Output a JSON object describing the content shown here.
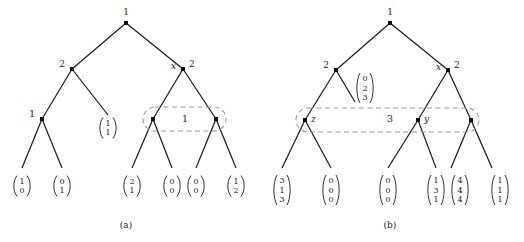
{
  "figure": {
    "background": "#ffffff",
    "ink": "#1a1a1a",
    "dash_color": "#9a9a9a"
  },
  "panels": [
    {
      "id": "a",
      "caption": "(a)",
      "caption_pos": {
        "x": 126,
        "y": 228
      },
      "nodes": [
        {
          "name": "root",
          "x": 126,
          "y": 23,
          "label": "1",
          "label_pos": "top",
          "lx": 126,
          "ly": 15
        },
        {
          "name": "left-2",
          "x": 72,
          "y": 69,
          "label": "2",
          "label_pos": "left",
          "lx": 65,
          "ly": 67
        },
        {
          "name": "right-2",
          "x": 183,
          "y": 69,
          "label": "2",
          "label_pos": "right",
          "lx": 189,
          "ly": 67
        },
        {
          "name": "right-2-x",
          "x": 183,
          "y": 69,
          "label": "x",
          "label_pos": "left-italic",
          "lx": 176,
          "ly": 69
        },
        {
          "name": "left-1",
          "x": 42,
          "y": 119,
          "label": "1",
          "label_pos": "left",
          "lx": 35,
          "ly": 117
        },
        {
          "name": "group-left",
          "x": 153,
          "y": 119,
          "label": "",
          "label_pos": "none",
          "lx": 0,
          "ly": 0
        },
        {
          "name": "group-right",
          "x": 216,
          "y": 119,
          "label": "",
          "label_pos": "none",
          "lx": 0,
          "ly": 0
        }
      ],
      "edges": [
        [
          126,
          23,
          72,
          69
        ],
        [
          126,
          23,
          183,
          69
        ],
        [
          72,
          69,
          42,
          119
        ],
        [
          72,
          69,
          108,
          115
        ],
        [
          183,
          69,
          153,
          119
        ],
        [
          183,
          69,
          216,
          119
        ],
        [
          42,
          119,
          22,
          168
        ],
        [
          42,
          119,
          62,
          168
        ],
        [
          153,
          119,
          132,
          168
        ],
        [
          153,
          119,
          172,
          168
        ],
        [
          216,
          119,
          196,
          168
        ],
        [
          216,
          119,
          236,
          168
        ]
      ],
      "group": {
        "name": "dashed-group-a",
        "label": "1",
        "label_x": 185,
        "label_y": 122,
        "x": 143,
        "y": 107,
        "width": 83,
        "height": 24
      },
      "vectors": [
        {
          "name": "vector-1-1-internal",
          "x": 108,
          "y": 128,
          "entries": [
            "1",
            "1"
          ]
        },
        {
          "name": "vector-leaf-1",
          "x": 22,
          "y": 186,
          "entries": [
            "1",
            "0"
          ]
        },
        {
          "name": "vector-leaf-2",
          "x": 62,
          "y": 186,
          "entries": [
            "0",
            "1"
          ]
        },
        {
          "name": "vector-leaf-3",
          "x": 132,
          "y": 186,
          "entries": [
            "2",
            "1"
          ]
        },
        {
          "name": "vector-leaf-4",
          "x": 172,
          "y": 186,
          "entries": [
            "0",
            "0"
          ]
        },
        {
          "name": "vector-leaf-5",
          "x": 196,
          "y": 186,
          "entries": [
            "0",
            "0"
          ]
        },
        {
          "name": "vector-leaf-6",
          "x": 236,
          "y": 186,
          "entries": [
            "1",
            "2"
          ]
        }
      ]
    },
    {
      "id": "b",
      "caption": "(b)",
      "caption_pos": {
        "x": 390,
        "y": 228
      },
      "nodes": [
        {
          "name": "root",
          "x": 390,
          "y": 23,
          "label": "1",
          "label_pos": "top",
          "lx": 390,
          "ly": 15
        },
        {
          "name": "left-2",
          "x": 336,
          "y": 70,
          "label": "2",
          "label_pos": "left",
          "lx": 329,
          "ly": 68
        },
        {
          "name": "right-2",
          "x": 448,
          "y": 70,
          "label": "2",
          "label_pos": "right",
          "lx": 454,
          "ly": 68
        },
        {
          "name": "right-2-x",
          "x": 448,
          "y": 70,
          "label": "x",
          "label_pos": "left-italic",
          "lx": 441,
          "ly": 70
        },
        {
          "name": "node-z",
          "x": 305,
          "y": 120,
          "label": "z",
          "label_pos": "right-italic",
          "lx": 311,
          "ly": 122
        },
        {
          "name": "node-y",
          "x": 418,
          "y": 120,
          "label": "y",
          "label_pos": "right-italic",
          "lx": 424,
          "ly": 122
        },
        {
          "name": "node-right-group",
          "x": 471,
          "y": 120,
          "label": "",
          "label_pos": "none",
          "lx": 0,
          "ly": 0
        }
      ],
      "edges": [
        [
          390,
          23,
          336,
          70
        ],
        [
          390,
          23,
          448,
          70
        ],
        [
          336,
          70,
          305,
          120
        ],
        [
          336,
          70,
          355,
          102
        ],
        [
          448,
          70,
          418,
          120
        ],
        [
          448,
          70,
          471,
          120
        ],
        [
          305,
          120,
          282,
          168
        ],
        [
          305,
          120,
          331,
          168
        ],
        [
          418,
          120,
          388,
          168
        ],
        [
          418,
          120,
          436,
          168
        ],
        [
          471,
          120,
          451,
          168
        ],
        [
          471,
          120,
          492,
          168
        ]
      ],
      "group": {
        "name": "dashed-group-b",
        "label": "3",
        "label_x": 390,
        "label_y": 122,
        "x": 296,
        "y": 108,
        "width": 183,
        "height": 24
      },
      "vectors": [
        {
          "name": "vector-0-2-3-internal",
          "x": 365,
          "y": 88,
          "entries": [
            "0",
            "2",
            "3"
          ]
        },
        {
          "name": "vector-leaf-1",
          "x": 282,
          "y": 190,
          "entries": [
            "3",
            "1",
            "3"
          ]
        },
        {
          "name": "vector-leaf-2",
          "x": 331,
          "y": 190,
          "entries": [
            "0",
            "0",
            "0"
          ]
        },
        {
          "name": "vector-leaf-3",
          "x": 388,
          "y": 190,
          "entries": [
            "0",
            "0",
            "0"
          ]
        },
        {
          "name": "vector-leaf-4",
          "x": 436,
          "y": 190,
          "entries": [
            "1",
            "3",
            "1"
          ]
        },
        {
          "name": "vector-leaf-5",
          "x": 460,
          "y": 190,
          "entries": [
            "4",
            "4",
            "4"
          ]
        },
        {
          "name": "vector-leaf-6",
          "x": 500,
          "y": 190,
          "entries": [
            "1",
            "1",
            "1"
          ]
        }
      ]
    }
  ]
}
